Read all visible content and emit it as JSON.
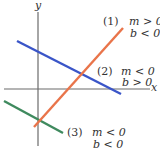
{
  "axes": {
    "x_label": "x",
    "y_label": "y",
    "axis_color": "#6b6b6b"
  },
  "lines": [
    {
      "id": "1",
      "number_label": "(1)",
      "cond1": "m > 0",
      "cond2": "b < 0",
      "color": "#e9744a",
      "x1": 34,
      "y1": 127,
      "x2": 123,
      "y2": 28
    },
    {
      "id": "2",
      "number_label": "(2)",
      "cond1": "m < 0",
      "cond2": "b > 0",
      "color": "#3a55c8",
      "x1": 17,
      "y1": 41,
      "x2": 121,
      "y2": 94
    },
    {
      "id": "3",
      "number_label": "(3)",
      "cond1": "m < 0",
      "cond2": "b < 0",
      "color": "#3f8a5e",
      "x1": 4,
      "y1": 101,
      "x2": 63,
      "y2": 133
    }
  ]
}
